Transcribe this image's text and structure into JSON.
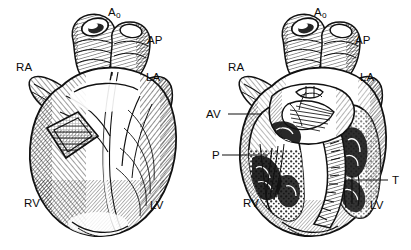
{
  "figure": {
    "background_color": "#ffffff",
    "ink_color": "#0b0b0b",
    "style": "black-and-white engraved line art with cross-hatching",
    "panel_count": 2
  },
  "panels": [
    {
      "id": "exterior-view",
      "name": "Intact heart, anterior exterior view",
      "position": "left",
      "has_cutaway_window": true,
      "window_shape": "diamond",
      "labels": [
        {
          "key": "Ao",
          "text": "Ao",
          "sub": "o",
          "base": "A",
          "x": 108,
          "y": 16,
          "leader": false
        },
        {
          "key": "AP",
          "text": "AP",
          "x": 147,
          "y": 44,
          "leader": false
        },
        {
          "key": "RA",
          "text": "RA",
          "x": 16,
          "y": 71,
          "leader": false
        },
        {
          "key": "LA",
          "text": "LA",
          "x": 146,
          "y": 81,
          "leader": false
        },
        {
          "key": "RV",
          "text": "RV",
          "x": 24,
          "y": 207,
          "leader": false
        },
        {
          "key": "LV",
          "text": "LV",
          "x": 150,
          "y": 209,
          "leader": false
        }
      ]
    },
    {
      "id": "sectioned-view",
      "name": "Heart in coronal section showing chambers and valves",
      "position": "right",
      "has_cutaway_window": false,
      "labels": [
        {
          "key": "Ao",
          "text": "Ao",
          "sub": "o",
          "base": "A",
          "x": 314,
          "y": 16,
          "leader": false
        },
        {
          "key": "AP",
          "text": "AP",
          "x": 355,
          "y": 44,
          "leader": false
        },
        {
          "key": "RA",
          "text": "RA",
          "x": 228,
          "y": 71,
          "leader": false
        },
        {
          "key": "LA",
          "text": "LA",
          "x": 360,
          "y": 81,
          "leader": false
        },
        {
          "key": "AV",
          "text": "AV",
          "x": 206,
          "y": 118,
          "leader": true,
          "leader_from_x": 228,
          "leader_to_x": 262,
          "leader_y": 114
        },
        {
          "key": "P",
          "text": "P",
          "x": 212,
          "y": 159,
          "leader": true,
          "leader_from_x": 222,
          "leader_to_x": 268,
          "leader_y": 155
        },
        {
          "key": "T",
          "text": "T",
          "x": 392,
          "y": 184,
          "leader": true,
          "leader_from_x": 388,
          "leader_to_x": 348,
          "leader_y": 180
        },
        {
          "key": "RV",
          "text": "RV",
          "x": 243,
          "y": 207,
          "leader": false
        },
        {
          "key": "LV",
          "text": "LV",
          "x": 370,
          "y": 209,
          "leader": false
        }
      ]
    }
  ],
  "legend_keys": {
    "Ao": "Aorta",
    "AP": "Arteria pulmonalis (pulmonary artery)",
    "RA": "Right atrium",
    "LA": "Left atrium",
    "RV": "Right ventricle",
    "LV": "Left ventricle",
    "AV": "Aortic valve",
    "P": "Pulmonary valve",
    "T": "Tricuspid valve"
  }
}
